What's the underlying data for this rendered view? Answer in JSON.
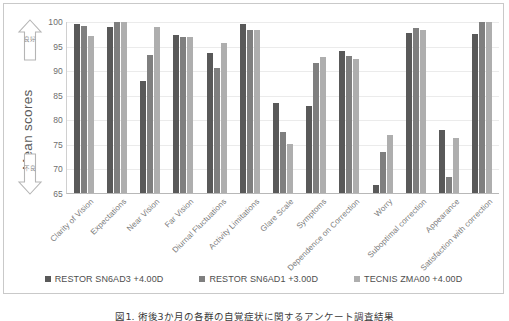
{
  "chart_data": {
    "type": "bar",
    "title": "",
    "xlabel": "",
    "ylabel": "Mean scores",
    "ylim": [
      65,
      100
    ],
    "yticks": [
      65,
      70,
      75,
      80,
      85,
      90,
      95,
      100
    ],
    "grid": true,
    "legend_position": "bottom",
    "categories": [
      "Clarity of Vision",
      "Expectations",
      "Near Vision",
      "Far Vision",
      "Diurnal Fluctuations",
      "Activity Limitations",
      "Glare Scale",
      "Symptoms",
      "Dependence on Correction",
      "Worry",
      "Suboptimal correction",
      "Appearance",
      "Satisfaction with correction"
    ],
    "series": [
      {
        "name": "RESTOR SN6AD3 +4.00D",
        "color": "#595959",
        "values": [
          99.3,
          98.8,
          87.7,
          97.1,
          93.5,
          99.4,
          83.3,
          82.7,
          93.9,
          66.6,
          97.6,
          77.8,
          97.4
        ]
      },
      {
        "name": "RESTOR SN6AD1 +3.00D",
        "color": "#7f7f7f",
        "values": [
          98.9,
          99.8,
          93.1,
          96.7,
          90.5,
          98.2,
          77.5,
          91.5,
          92.8,
          73.3,
          98.5,
          68.2,
          99.8
        ]
      },
      {
        "name": "TECNIS ZMA00 +4.00D",
        "color": "#aeaeae",
        "values": [
          96.9,
          99.8,
          98.8,
          96.8,
          95.5,
          98.2,
          74.9,
          92.7,
          92.3,
          76.8,
          98.1,
          76.1,
          99.8
        ]
      }
    ],
    "annotations": [
      {
        "name": "good-arrow",
        "direction": "up",
        "label": "良好"
      },
      {
        "name": "poor-arrow",
        "direction": "down",
        "label": "不良"
      }
    ]
  },
  "caption": {
    "text": "図1. 術後3か月の各群の自覚症状に関するアンケート調査結果"
  }
}
